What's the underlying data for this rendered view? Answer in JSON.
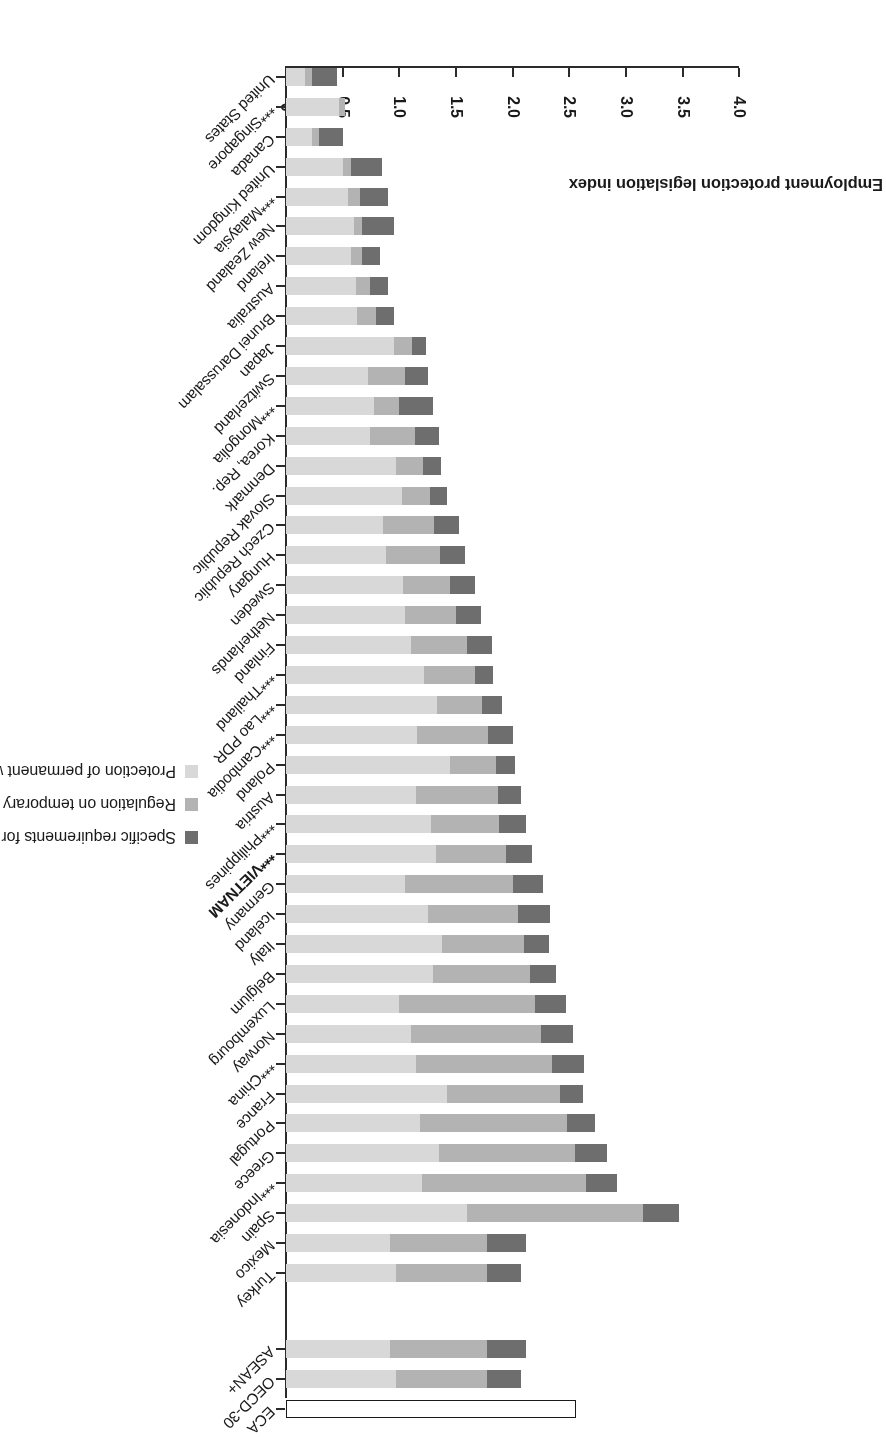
{
  "chart_data": {
    "type": "bar",
    "subtype": "horizontal-stacked",
    "title": "",
    "xlabel": "",
    "ylabel": "Employment protection legislation index",
    "ylim": [
      0,
      4.0
    ],
    "y_ticks": [
      "0",
      "0.5",
      "1.0",
      "1.5",
      "2.0",
      "2.5",
      "3.0",
      "3.5",
      "4.0"
    ],
    "grid": false,
    "legend_position": "bottom",
    "orientation_note": "figure rendered rotated 180 degrees",
    "legend": [
      "Specific requirements for collective dismissal",
      "Regulation on temporary forms of employment",
      "Protection of permanent workers against (individual) dismissal"
    ],
    "series": [
      {
        "name": "Protection of permanent workers against (individual) dismissal",
        "color": "#d8d8d8",
        "values": [
          0.17,
          0.47,
          0.23,
          0.5,
          0.55,
          0.6,
          0.57,
          0.62,
          0.63,
          0.95,
          0.72,
          0.78,
          0.74,
          0.97,
          1.02,
          0.86,
          0.88,
          1.03,
          1.05,
          1.1,
          1.22,
          1.33,
          1.16,
          1.45,
          1.15,
          1.28,
          1.32,
          1.05,
          1.25,
          1.38,
          1.3,
          1.0,
          1.1,
          1.15,
          1.42,
          1.18,
          1.35,
          1.2,
          1.6,
          0.92,
          0.97
        ]
      },
      {
        "name": "Regulation on temporary forms of employment",
        "color": "#b3b3b3",
        "values": [
          0.06,
          0.05,
          0.06,
          0.07,
          0.1,
          0.07,
          0.1,
          0.12,
          0.16,
          0.16,
          0.33,
          0.22,
          0.4,
          0.24,
          0.25,
          0.45,
          0.48,
          0.42,
          0.45,
          0.5,
          0.45,
          0.4,
          0.62,
          0.4,
          0.72,
          0.6,
          0.62,
          0.95,
          0.8,
          0.72,
          0.85,
          1.2,
          1.15,
          1.2,
          1.0,
          1.3,
          1.2,
          1.45,
          1.55,
          0.85,
          0.8
        ]
      },
      {
        "name": "Specific requirements for collective dismissal",
        "color": "#6e6e6e",
        "values": [
          0.22,
          0.0,
          0.21,
          0.28,
          0.25,
          0.28,
          0.16,
          0.16,
          0.16,
          0.13,
          0.2,
          0.3,
          0.21,
          0.16,
          0.15,
          0.22,
          0.22,
          0.22,
          0.22,
          0.22,
          0.16,
          0.18,
          0.22,
          0.17,
          0.2,
          0.24,
          0.23,
          0.27,
          0.28,
          0.22,
          0.23,
          0.27,
          0.28,
          0.28,
          0.2,
          0.25,
          0.28,
          0.27,
          0.32,
          0.35,
          0.3
        ]
      }
    ],
    "categories": [
      "United States",
      "***Singapore",
      "Canada",
      "United Kingdom",
      "***Malaysia",
      "New Zealand",
      "Ireland",
      "Australia",
      "Brunei Darussalam",
      "Japan",
      "Switzerland",
      "***Mongolia",
      "Korea, Rep.",
      "Denmark",
      "Slovak Republic",
      "Czech Republic",
      "Hungary",
      "Sweden",
      "Netherlands",
      "Finland",
      "***Thailand",
      "***Lao PDR",
      "***Cambodia",
      "Poland",
      "Austria",
      "***Philippines",
      "***VIETNAM",
      "Germany",
      "Iceland",
      "Italy",
      "Belgium",
      "Luxembourg",
      "Norway",
      "***China",
      "France",
      "Portugal",
      "Greece",
      "***Indonesia",
      "Spain",
      "Mexico",
      "Turkey"
    ],
    "totals": [
      0.45,
      0.52,
      0.5,
      0.85,
      0.9,
      0.95,
      0.83,
      0.9,
      0.95,
      1.24,
      1.25,
      1.3,
      1.35,
      1.37,
      1.42,
      1.53,
      1.58,
      1.67,
      1.72,
      1.82,
      1.83,
      1.91,
      2.0,
      2.02,
      2.07,
      2.12,
      2.17,
      2.27,
      2.33,
      2.32,
      2.38,
      2.47,
      2.53,
      2.63,
      2.62,
      2.73,
      2.83,
      2.92,
      3.47,
      2.12,
      2.07
    ],
    "aggregates": [
      {
        "label": "ASEAN+",
        "total": 2.12,
        "outline": false
      },
      {
        "label": "OECD-30",
        "total": 2.07,
        "outline": false
      },
      {
        "label": "ECA",
        "total": 2.56,
        "outline": true
      }
    ],
    "footnote": ""
  },
  "axis": {
    "title": "Employment protection legislation index",
    "ticks": [
      {
        "label": "0",
        "value": 0.0
      },
      {
        "label": "0.5",
        "value": 0.5
      },
      {
        "label": "1.0",
        "value": 1.0
      },
      {
        "label": "1.5",
        "value": 1.5
      },
      {
        "label": "2.0",
        "value": 2.0
      },
      {
        "label": "2.5",
        "value": 2.5
      },
      {
        "label": "3.0",
        "value": 3.0
      },
      {
        "label": "3.5",
        "value": 3.5
      },
      {
        "label": "4.0",
        "value": 4.0
      }
    ]
  },
  "legend": {
    "items": [
      {
        "label": "Specific requirements for collective dismissal",
        "color": "#6e6e6e"
      },
      {
        "label": "Regulation on temporary forms of employment",
        "color": "#b3b3b3"
      },
      {
        "label": "Protection of permanent workers against (individual) dismissal",
        "color": "#d8d8d8"
      }
    ]
  }
}
